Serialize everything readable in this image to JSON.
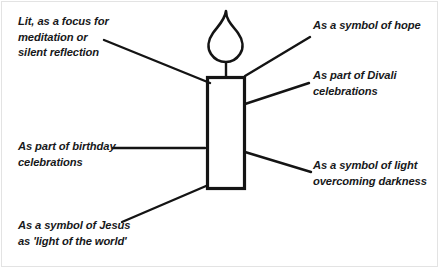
{
  "diagram": {
    "title": "",
    "ink_color": "#141414",
    "frame_color": "#e3e3e3",
    "background_color": "#ffffff",
    "center_figure": {
      "name": "candle",
      "parts": [
        {
          "name": "flame",
          "shape": "teardrop-pointed"
        },
        {
          "name": "wick",
          "shape": "vertical-line"
        },
        {
          "name": "candle-body",
          "shape": "rectangle-outline"
        }
      ]
    },
    "labels": [
      {
        "id": "meditation",
        "text": "Lit, as a focus for\nmeditation or\nsilent reflection",
        "side": "left",
        "position": "top-left"
      },
      {
        "id": "hope",
        "text": "As a symbol of hope",
        "side": "right",
        "position": "top-right"
      },
      {
        "id": "divali",
        "text": "As part of Divali\ncelebrations",
        "side": "right",
        "position": "upper-right"
      },
      {
        "id": "birthday",
        "text": "As part of birthday\ncelebrations",
        "side": "left",
        "position": "middle-left"
      },
      {
        "id": "light",
        "text": "As a symbol of light\novercoming darkness",
        "side": "right",
        "position": "lower-right"
      },
      {
        "id": "jesus",
        "text": "As a symbol of Jesus\nas 'light of the world'",
        "side": "left",
        "position": "bottom-left"
      }
    ],
    "leader_lines": [
      {
        "id": "leader-meditation",
        "from": [
          104,
          40
        ],
        "to": [
          210,
          83
        ]
      },
      {
        "id": "leader-hope",
        "from": [
          245,
          76
        ],
        "to": [
          310,
          37
        ]
      },
      {
        "id": "leader-divali",
        "from": [
          245,
          104
        ],
        "to": [
          309,
          83
        ]
      },
      {
        "id": "leader-birthday",
        "from": [
          113,
          148
        ],
        "to": [
          205,
          148
        ]
      },
      {
        "id": "leader-light",
        "from": [
          245,
          152
        ],
        "to": [
          311,
          172
        ]
      },
      {
        "id": "leader-jesus",
        "from": [
          122,
          222
        ],
        "to": [
          206,
          186
        ]
      }
    ]
  }
}
